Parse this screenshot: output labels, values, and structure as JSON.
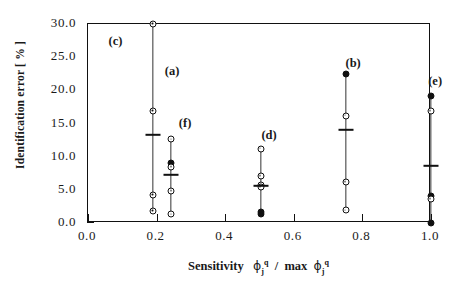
{
  "figure": {
    "panel_label": "(c)",
    "panel_label_pos": {
      "x": 0.06,
      "y": 27.3
    }
  },
  "chart_data": {
    "type": "scatter",
    "title": "",
    "subtitle": "",
    "xlabel": "Sensitivity  φ j q / max φ j q",
    "xlabel_parts": {
      "prefix": "Sensitivity",
      "numerator_phi": "ϕ",
      "numerator_sub": "j",
      "numerator_sup": "q",
      "divider": "/",
      "max": "max",
      "denominator_phi": "ϕ",
      "denominator_sub": "j",
      "denominator_sup": "q"
    },
    "ylabel": "Identification error [ % ]",
    "xlim": [
      0.0,
      1.0
    ],
    "ylim": [
      0.0,
      30.0
    ],
    "xticks": [
      0.0,
      0.2,
      0.4,
      0.6,
      0.8,
      1.0
    ],
    "xticklabels": [
      "0.0",
      "0.2",
      "0.4",
      "0.6",
      "0.8",
      "1.0"
    ],
    "yticks": [
      0.0,
      5.0,
      10.0,
      15.0,
      20.0,
      25.0,
      30.0
    ],
    "yticklabels": [
      "0.0",
      "5.0",
      "10.0",
      "15.0",
      "20.0",
      "25.0",
      "30.0"
    ],
    "grid": false,
    "legend": "none",
    "marker": "open-circle-with-dot",
    "series": [
      {
        "name": "(a)",
        "label": "(a)",
        "x": 0.19,
        "label_x": 0.245,
        "label_y": 22.8,
        "values": [
          30.0,
          16.9,
          4.2,
          1.8
        ],
        "solid": [
          false,
          false,
          false,
          false
        ],
        "mean": 13.2,
        "range": [
          1.8,
          30.0
        ]
      },
      {
        "name": "(f)",
        "label": "(f)",
        "x": 0.243,
        "label_x": 0.283,
        "label_y": 15.0,
        "values": [
          12.6,
          9.0,
          8.4,
          4.8,
          1.3
        ],
        "solid": [
          false,
          true,
          false,
          false,
          false
        ],
        "mean": 7.2,
        "range": [
          1.3,
          12.6
        ]
      },
      {
        "name": "(d)",
        "label": "(d)",
        "x": 0.503,
        "label_x": 0.528,
        "label_y": 13.1,
        "values": [
          11.2,
          7.1,
          5.8,
          5.4,
          1.7,
          1.4
        ],
        "solid": [
          false,
          false,
          false,
          false,
          true,
          true
        ],
        "mean": 5.6,
        "range": [
          1.4,
          11.2
        ]
      },
      {
        "name": "(b)",
        "label": "(b)",
        "x": 0.751,
        "label_x": 0.773,
        "label_y": 24.0,
        "values": [
          22.5,
          16.2,
          6.2,
          1.9
        ],
        "solid": [
          true,
          false,
          false,
          false
        ],
        "mean": 14.0,
        "range": [
          1.9,
          22.5
        ]
      },
      {
        "name": "(e)",
        "label": "(e)",
        "x": 0.999,
        "label_x": 1.012,
        "label_y": 21.2,
        "values": [
          19.2,
          16.9,
          4.0,
          3.6,
          0.0
        ],
        "solid": [
          true,
          false,
          true,
          false,
          true
        ],
        "mean": 8.6,
        "range": [
          0.0,
          19.2
        ]
      }
    ]
  }
}
